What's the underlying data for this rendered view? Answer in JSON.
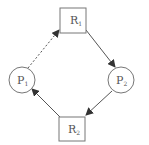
{
  "diagram": {
    "type": "resource-allocation-graph",
    "colors": {
      "stroke": "#555555",
      "arrow": "#333333",
      "fill": "#ffffff",
      "text": "#555555"
    },
    "nodes": [
      {
        "id": "R1",
        "kind": "resource",
        "label": "R",
        "sub": "1",
        "shape": "rect",
        "x": 60,
        "y": 8,
        "w": 26,
        "h": 25
      },
      {
        "id": "P2",
        "kind": "process",
        "label": "P",
        "sub": "2",
        "shape": "circle",
        "cx": 121,
        "cy": 80,
        "r": 13
      },
      {
        "id": "R2",
        "kind": "resource",
        "label": "R",
        "sub": "2",
        "shape": "rect",
        "x": 59,
        "y": 117,
        "w": 26,
        "h": 24
      },
      {
        "id": "P1",
        "kind": "process",
        "label": "P",
        "sub": "1",
        "shape": "circle",
        "cx": 22,
        "cy": 80,
        "r": 13
      }
    ],
    "edges": [
      {
        "from": "R1",
        "to": "P2",
        "style": "solid",
        "meaning": "assignment"
      },
      {
        "from": "P2",
        "to": "R2",
        "style": "solid",
        "meaning": "request"
      },
      {
        "from": "R2",
        "to": "P1",
        "style": "solid",
        "meaning": "assignment"
      },
      {
        "from": "P1",
        "to": "R1",
        "style": "dashed",
        "meaning": "claim"
      }
    ]
  }
}
